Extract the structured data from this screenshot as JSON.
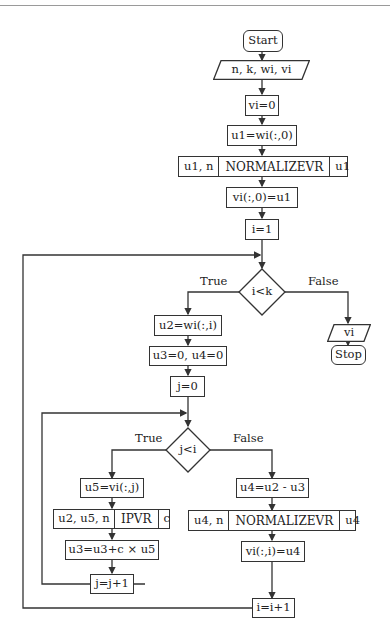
{
  "flowchart": {
    "start": "Start",
    "input": "n, k, wi, vi",
    "init_vi": "vi=0",
    "u1_assign": "u1=wi(:,0)",
    "normalize1": {
      "inputs": "u1, n",
      "name": "NORMALIZEVR",
      "output": "u1"
    },
    "vi0_assign": "vi(:,0)=u1",
    "i_init": "i=1",
    "cond_outer": {
      "text": "i<k",
      "true_label": "True",
      "false_label": "False"
    },
    "output": "vi",
    "stop": "Stop",
    "u2_assign": "u2=wi(:,i)",
    "u3u4_init": "u3=0, u4=0",
    "j_init": "j=0",
    "cond_inner": {
      "text": "j<i",
      "true_label": "True",
      "false_label": "False"
    },
    "u5_assign": "u5=vi(:,j)",
    "ipvr": {
      "inputs": "u2, u5, n",
      "name": "IPVR",
      "output": "c"
    },
    "u3_update": "u3=u3+c × u5",
    "j_inc": "j=j+1",
    "u4_assign": "u4=u2 - u3",
    "normalize2": {
      "inputs": "u4, n",
      "name": "NORMALIZEVR",
      "output": "u4"
    },
    "vii_assign": "vi(:,i)=u4",
    "i_inc": "i=i+1"
  },
  "colors": {
    "stroke": "#333333",
    "background": "#ffffff",
    "rule": "#9a9a9a"
  }
}
